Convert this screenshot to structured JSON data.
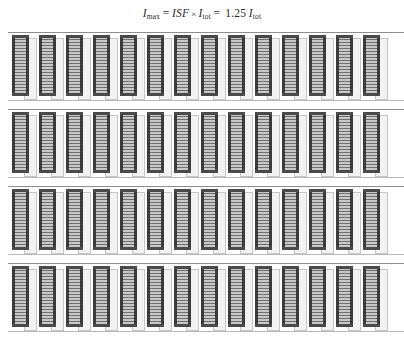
{
  "figure": {
    "type": "datacenter-floorplan-illustration",
    "background_color": "#ffffff"
  },
  "formula": {
    "full_text": "I_max = ISF × I_tot = 1.25 I_tot",
    "lhs_symbol": "I",
    "lhs_subscript": "max",
    "equals_1": "=",
    "factor_symbol": "ISF",
    "times_operator": "×",
    "current_symbol": "I",
    "current_subscript": "tot",
    "equals_2": "=",
    "coefficient": "1.25",
    "result_symbol": "I",
    "result_subscript": "tot"
  },
  "hall": {
    "row_count": 4,
    "cabinets_per_row": 14,
    "rows": [
      {
        "id": "row-1",
        "label": "Rack row 1",
        "cabinet_count": 14,
        "top": 0
      },
      {
        "id": "row-2",
        "label": "Rack row 2",
        "cabinet_count": 14,
        "top": 77
      },
      {
        "id": "row-3",
        "label": "Rack row 3",
        "cabinet_count": 14,
        "top": 154
      },
      {
        "id": "row-4",
        "label": "Rack row 4",
        "cabinet_count": 14,
        "top": 231
      }
    ]
  },
  "colors": {
    "rack_frame": "#3a3a3a",
    "rack_fill": "#9b9b9b",
    "rack_stripe_dark": "#6f6f6f",
    "rack_stripe_light": "#c8c8c8",
    "side_panel": "#f2f2f2",
    "side_panel_border": "#c6c6c6",
    "floor_line": "#8d8d8d",
    "text": "#2a2a2a"
  }
}
